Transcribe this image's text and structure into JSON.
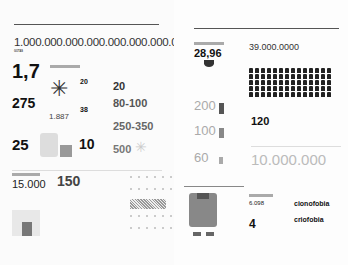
{
  "left_page": {
    "running_header": "",
    "section": "",
    "headline": "1.000.000.000.000.000.000.000.000",
    "headline_label": "GOTAS",
    "headline_desc": "",
    "stats": [
      {
        "value": "1,7",
        "label": "",
        "desc": ""
      },
      {
        "value": "275",
        "label": "",
        "desc": ""
      },
      {
        "value": "25",
        "label": "",
        "desc": ""
      },
      {
        "value": "20",
        "label": "",
        "desc": ""
      },
      {
        "value": "38",
        "label": "",
        "desc": ""
      },
      {
        "value": "1.887",
        "label": "",
        "desc": ""
      },
      {
        "value": "10",
        "label": "",
        "desc": ""
      }
    ],
    "column3": [
      {
        "value": "20",
        "label": "",
        "desc": ""
      },
      {
        "value": "80-100",
        "label": "",
        "desc": ""
      },
      {
        "value": "250-350",
        "label": "",
        "desc": ""
      },
      {
        "value": "500",
        "label": "",
        "desc": ""
      }
    ],
    "bottom_left": {
      "value": "15.000",
      "label": ""
    },
    "bottom_mid": {
      "value": "150",
      "label": "",
      "bullets": [
        "",
        "",
        "",
        ""
      ]
    },
    "pattern_labels": [
      "",
      "",
      "",
      "",
      ""
    ],
    "page_number": ""
  },
  "right_page": {
    "section": "",
    "main_value": "28,96",
    "crowd_value": "39.000.0000",
    "towers": [
      {
        "value": "200"
      },
      {
        "value": "100"
      },
      {
        "value": "60"
      }
    ],
    "value_120": "120",
    "value_10m": "10.000.000",
    "robot_values": [
      {
        "value": "6.098"
      },
      {
        "value": "4"
      }
    ],
    "words": [
      {
        "word": "cionofobia"
      },
      {
        "word": "criofobia"
      }
    ]
  }
}
